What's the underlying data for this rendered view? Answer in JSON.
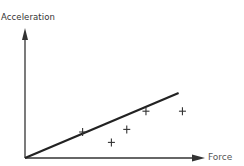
{
  "chart_data": {
    "type": "scatter",
    "title": "",
    "xlabel": "Force",
    "ylabel": "Acceleration",
    "grid": false,
    "legend": null,
    "axis_ticks": false,
    "xlim": [
      0,
      10
    ],
    "ylim": [
      0,
      10
    ],
    "series": [
      {
        "name": "measurements",
        "marker": "+",
        "x": [
          3.0,
          4.5,
          5.3,
          6.3,
          8.2
        ],
        "y": [
          2.0,
          1.2,
          2.2,
          3.6,
          3.6
        ]
      }
    ],
    "fit_line": {
      "name": "best-fit line",
      "x": [
        0,
        8.0
      ],
      "y": [
        0,
        5.0
      ]
    },
    "annotations": []
  },
  "labels": {
    "y_axis": "Acceleration",
    "x_axis": "Force"
  }
}
